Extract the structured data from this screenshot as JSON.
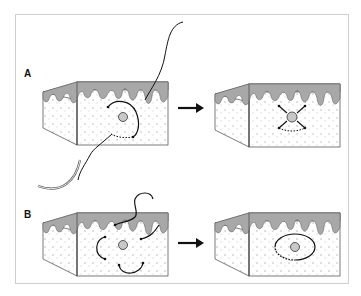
{
  "figure": {
    "panels": [
      {
        "label": "A",
        "before": "Tissue block with suture needle placing a purse-string stitch around a central lesion",
        "after": "Tissue block with cross-shaped suture closure around central lesion"
      },
      {
        "label": "B",
        "before": "Tissue block with multiple curved suture segments placed around central lesion",
        "after": "Tissue block with elliptical closure around central lesion"
      }
    ],
    "arrow_icon": "right-arrow",
    "colors": {
      "epidermis": "#a8a8a8",
      "dermis_speckle": "#d6d6d6",
      "outline": "#444444",
      "suture": "#111111",
      "frame": "#cfcfcf"
    }
  }
}
